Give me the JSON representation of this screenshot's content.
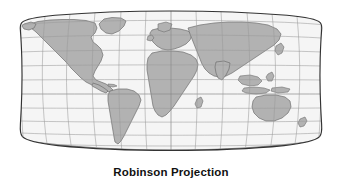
{
  "figure": {
    "caption": "Robinson Projection",
    "background_color": "#ffffff"
  },
  "map": {
    "projection_name": "Robinson",
    "title": "Robinson Projection",
    "ocean_color": "#f5f5f5",
    "land_color": "#b2b2b2",
    "coastline_color": "#6e6e6e",
    "graticule_color": "#9a9a9a",
    "border_color": "#333333",
    "extent": {
      "left_px": 20,
      "right_px": 322,
      "top_px": 11,
      "bottom_px": 163
    },
    "graticule": {
      "meridian_spacing_degrees": 30,
      "parallel_spacing_degrees": 15,
      "meridian_count": 13,
      "parallel_count": 11,
      "meridian_labels": [
        "180W",
        "150W",
        "120W",
        "90W",
        "60W",
        "30W",
        "0",
        "30E",
        "60E",
        "90E",
        "120E",
        "150E",
        "180E"
      ],
      "parallel_labels": [
        "75N",
        "60N",
        "45N",
        "30N",
        "15N",
        "0",
        "15S",
        "30S",
        "45S",
        "60S",
        "75S"
      ]
    },
    "landmasses": [
      "North America",
      "Greenland",
      "South America",
      "Europe",
      "Africa",
      "Asia",
      "Australia",
      "Antarctica"
    ]
  }
}
